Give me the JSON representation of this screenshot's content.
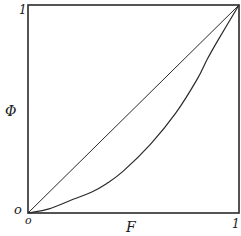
{
  "chart_data": {
    "type": "line",
    "title": "",
    "xlabel": "F",
    "ylabel": "Φ",
    "xlim": [
      0,
      1
    ],
    "ylim": [
      0,
      1
    ],
    "grid": false,
    "legend": null,
    "x_ticks": [
      {
        "value": 0,
        "label": "o"
      },
      {
        "value": 1,
        "label": "1"
      }
    ],
    "y_ticks": [
      {
        "value": 0,
        "label": "o"
      },
      {
        "value": 1,
        "label": "1"
      }
    ],
    "series": [
      {
        "name": "equality-line",
        "style": "straight",
        "x": [
          0,
          1
        ],
        "y": [
          0,
          1
        ]
      },
      {
        "name": "lorenz-curve",
        "style": "curve",
        "x": [
          0,
          0.1,
          0.2,
          0.3,
          0.37,
          0.45,
          0.58,
          0.7,
          0.8,
          0.85,
          0.9,
          1.0
        ],
        "y": [
          0,
          0.02,
          0.06,
          0.1,
          0.14,
          0.2,
          0.33,
          0.48,
          0.64,
          0.74,
          0.83,
          1.0
        ]
      }
    ]
  },
  "labels": {
    "x_axis": "F",
    "y_axis": "Φ",
    "x_origin": "o",
    "y_origin": "o",
    "x_max": "1",
    "y_max": "1"
  }
}
